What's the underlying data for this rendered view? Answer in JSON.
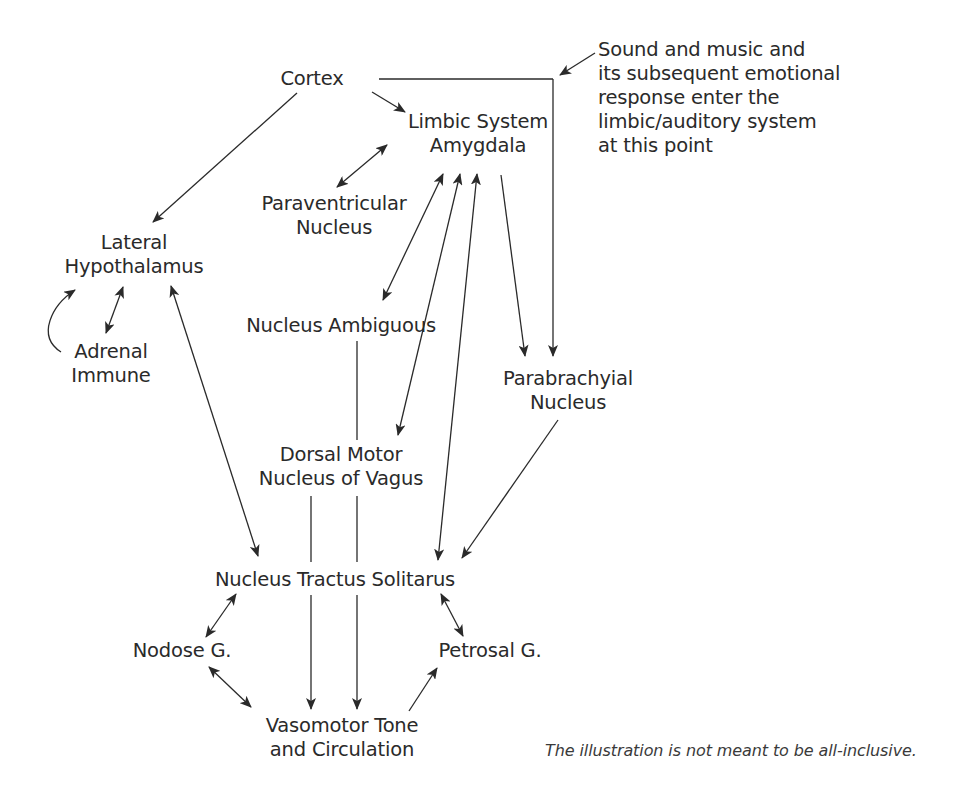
{
  "diagram": {
    "nodes": {
      "cortex": "Cortex",
      "limbic_line1": "Limbic System",
      "limbic_line2": "Amygdala",
      "paraventricular_line1": "Paraventricular",
      "paraventricular_line2": "Nucleus",
      "lateral_line1": "Lateral",
      "lateral_line2": "Hypothalamus",
      "adrenal_line1": "Adrenal",
      "adrenal_line2": "Immune",
      "ambiguous": "Nucleus Ambiguous",
      "parabrachyial_line1": "Parabrachyial",
      "parabrachyial_line2": "Nucleus",
      "dorsal_line1": "Dorsal Motor",
      "dorsal_line2": "Nucleus of Vagus",
      "nts": "Nucleus Tractus Solitarus",
      "nodose": "Nodose G.",
      "petrosal": "Petrosal G.",
      "vasomotor_line1": "Vasomotor Tone",
      "vasomotor_line2": "and Circulation"
    },
    "annotation": {
      "line1": "Sound and music and",
      "line2": "its subsequent emotional",
      "line3": "response enter the",
      "line4": "limbic/auditory system",
      "line5": "at this point"
    },
    "caption": "The illustration is not meant to be all-inclusive.",
    "colors": {
      "ink": "#2a2a2a",
      "background": "#ffffff"
    }
  }
}
